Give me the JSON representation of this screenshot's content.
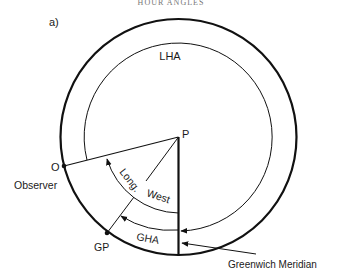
{
  "header": {
    "caption": "HOUR ANGLES"
  },
  "figure": {
    "panel_label": "a)",
    "labels": {
      "lha": "LHA",
      "pole": "P",
      "observer_point": "O",
      "observer": "Observer",
      "long": "Long.",
      "west": "West",
      "gha": "GHA",
      "gp": "GP",
      "greenwich": "Greenwich Meridian"
    },
    "colors": {
      "line": "#111111",
      "text": "#1a1a1a"
    }
  }
}
